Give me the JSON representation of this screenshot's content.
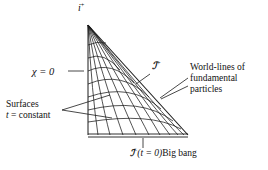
{
  "figure": {
    "type": "spacetime-conformal-diagram",
    "background_color": "#ffffff",
    "line_color": "#1a1a1a"
  },
  "labels": {
    "timelike_infinity": {
      "symbol": "i",
      "superscript": "+",
      "text": "i+"
    },
    "chi_axis": {
      "text": "χ = 0",
      "symbol": "χ",
      "value": "0"
    },
    "scri_plus": {
      "symbol": "ℐ",
      "superscript": "+",
      "text": "ℐ+"
    },
    "worldlines": {
      "line1": "World-lines of",
      "line2": "fundamental",
      "line3": "particles"
    },
    "surfaces": {
      "line1": "Surfaces",
      "line2_symbol": "t",
      "line2_rest": " = constant",
      "line2": "t = constant"
    },
    "big_bang": {
      "symbol": "ℐ",
      "superscript": "−",
      "time": "(t = 0)",
      "name": "Big bang",
      "text": "ℐ− (t = 0)Big bang"
    }
  },
  "geometry": {
    "apex": [
      88,
      25
    ],
    "bottom_left": [
      88,
      135
    ],
    "bottom_right": [
      188,
      135
    ],
    "worldline_count": 9,
    "tsurface_count": 7,
    "bottom_tick_x": 143
  }
}
